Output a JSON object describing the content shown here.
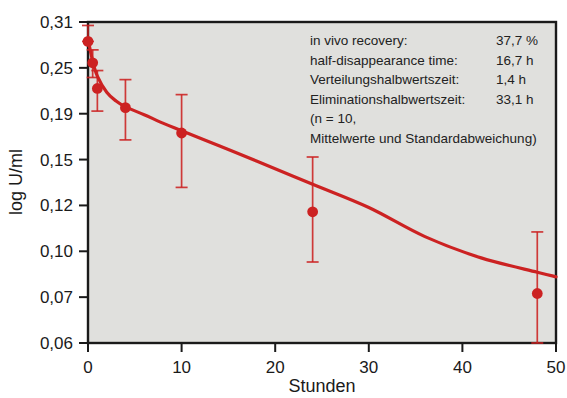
{
  "chart_data": {
    "type": "scatter",
    "title": "",
    "xlabel": "Stunden",
    "ylabel": "log U/ml",
    "xlim": [
      0,
      50
    ],
    "ylim": [
      0.06,
      0.31
    ],
    "yscale": "log",
    "grid": false,
    "legend_position": "top-right",
    "xticks": [
      "0",
      "10",
      "20",
      "30",
      "40",
      "50"
    ],
    "xtick_values": [
      0,
      10,
      20,
      30,
      40,
      50
    ],
    "yticks": [
      "0,31",
      "0,25",
      "0,19",
      "0,15",
      "0,12",
      "0,10",
      "0,07",
      "0,06"
    ],
    "ytick_values": [
      0.31,
      0.25,
      0.19,
      0.15,
      0.12,
      0.1,
      0.07,
      0.06
    ],
    "series": [
      {
        "name": "Mittelwerte und Standardabweichung",
        "color": "#cc2222",
        "x": [
          0,
          0.5,
          1,
          4,
          10,
          24,
          48
        ],
        "y": [
          0.283,
          0.256,
          0.221,
          0.197,
          0.172,
          0.117,
          0.072
        ],
        "yerr_low": [
          0.283,
          0.236,
          0.193,
          0.166,
          0.131,
          0.092,
          0.06
        ],
        "yerr_high": [
          0.305,
          0.272,
          0.246,
          0.233,
          0.213,
          0.152,
          0.108
        ]
      }
    ],
    "fit_curve": {
      "name": "biexponential fit",
      "color": "#cc2222",
      "x": [
        0,
        0.5,
        1,
        2,
        3,
        4,
        6,
        8,
        10,
        14,
        18,
        24,
        30,
        36,
        42,
        48,
        50
      ],
      "y": [
        0.286,
        0.258,
        0.238,
        0.216,
        0.205,
        0.198,
        0.189,
        0.181,
        0.174,
        0.161,
        0.149,
        0.133,
        0.119,
        0.106,
        0.095,
        0.085,
        0.082
      ]
    },
    "annotations": {
      "rows": [
        {
          "label": "in vivo recovery:",
          "value": "37,7 %"
        },
        {
          "label": "half-disappearance time:",
          "value": "16,7 h"
        },
        {
          "label": "Verteilungshalbwertszeit:",
          "value": "1,4 h"
        },
        {
          "label": "Eliminationshalbwertszeit:",
          "value": "33,1 h"
        }
      ],
      "note_line1": "(n = 10,",
      "note_line2": "Mittelwerte und Standardabweichung)"
    },
    "colors": {
      "plot_background": "#e0e0dd",
      "frame": "#1a1a1a",
      "data": "#cc2222",
      "text": "#1a1a1a"
    }
  }
}
